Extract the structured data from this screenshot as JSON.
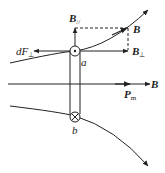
{
  "diagram": {
    "type": "magnetic-field-force-diagram",
    "labels": {
      "B_parallel": "B",
      "B_parallel_sub": "//",
      "B": "B",
      "B_perp": "B",
      "B_perp_sub": "⊥",
      "dF": "dF",
      "dF_sub": "⊥",
      "a": "a",
      "b": "b",
      "Pm": "P",
      "Pm_sub": "m",
      "B_axis": "B"
    },
    "colors": {
      "stroke": "#222222",
      "background": "#ffffff"
    }
  }
}
